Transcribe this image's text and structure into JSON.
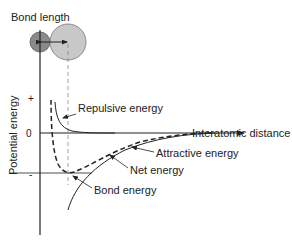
{
  "title": "Bond length",
  "axes": {
    "y_label": "Potential energy",
    "x_label": "Interatomic distance",
    "y_tick_plus": "+",
    "y_tick_zero": "0",
    "y_tick_minus": "-"
  },
  "curves": {
    "repulsive": "Repulsive energy",
    "attractive": "Attractive energy",
    "net": "Net energy",
    "bond": "Bond energy"
  },
  "colors": {
    "small_atom": "#8a8a8a",
    "large_atom": "#c8c8c8",
    "line": "#222222"
  }
}
